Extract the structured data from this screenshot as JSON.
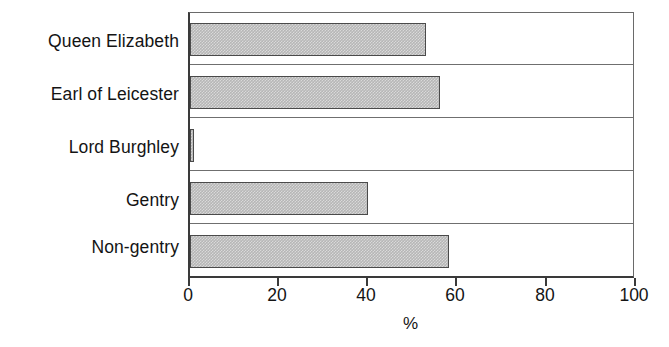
{
  "chart_data": {
    "type": "bar",
    "orientation": "horizontal",
    "title": "",
    "subtitle": "",
    "xlabel": "%",
    "ylabel": "",
    "categories": [
      "Queen Elizabeth",
      "Earl of Leicester",
      "Lord Burghley",
      "Gentry",
      "Non-gentry"
    ],
    "values": [
      53,
      56,
      1,
      40,
      58
    ],
    "series": [
      {
        "name": "",
        "values": [
          53,
          56,
          1,
          40,
          58
        ]
      }
    ],
    "xlim": [
      0,
      100
    ],
    "xticks": [
      0,
      20,
      40,
      60,
      80,
      100
    ],
    "xtick_labels": [
      "0",
      "20",
      "40",
      "60",
      "80",
      "100"
    ],
    "grid": false,
    "legend": null,
    "legend_position": "none",
    "annotations": [],
    "bar_fill_color": "#b6b6b6",
    "bar_border_color": "#4a4a4a",
    "axis_color": "#3a3a3a",
    "background_color": "#ffffff"
  }
}
